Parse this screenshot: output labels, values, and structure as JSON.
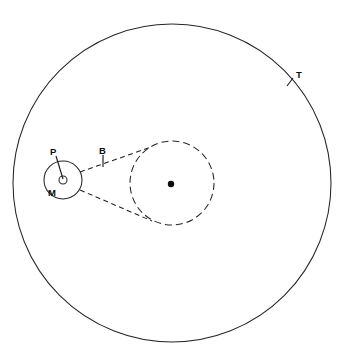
{
  "figure": {
    "background_color": "#ffffff",
    "stroke_color": "#262626",
    "label_color": "#0d0d0d",
    "width": 345,
    "height": 362
  },
  "labels": {
    "outer_orbit": "T",
    "small_body": "P",
    "small_orbit": "M",
    "tangent": "B"
  },
  "shapes": {
    "outer_circle": {
      "name": "outer-orbit-circle",
      "cx": 172,
      "cy": 183,
      "r": 159,
      "style": "solid"
    },
    "dashed_circle": {
      "name": "dashed-orbit-circle",
      "cx": 172,
      "cy": 183,
      "r": 42,
      "style": "dashed"
    },
    "small_circle": {
      "name": "small-orbit-circle",
      "cx": 63,
      "cy": 180,
      "r": 19,
      "style": "solid"
    },
    "tiny_circle": {
      "name": "observer-marker-circle",
      "cx": 63,
      "cy": 180,
      "r": 4,
      "style": "solid-open"
    },
    "center_dot": {
      "name": "center-body-dot",
      "cx": 171,
      "cy": 184,
      "r": 3.2,
      "style": "filled"
    }
  },
  "tangents": [
    {
      "name": "upper-tangent-line",
      "x1": 80,
      "y1": 172,
      "x2": 151,
      "y2": 147
    },
    {
      "name": "lower-tangent-line",
      "x1": 80,
      "y1": 190,
      "x2": 152,
      "y2": 221
    }
  ],
  "leaders": [
    {
      "name": "label-leader-T",
      "x1": 293,
      "y1": 78,
      "x2": 287,
      "y2": 86
    },
    {
      "name": "label-leader-P",
      "x1": 56,
      "y1": 156,
      "x2": 63,
      "y2": 179
    },
    {
      "name": "label-leader-B",
      "x1": 103,
      "y1": 155,
      "x2": 103,
      "y2": 167
    }
  ],
  "label_positions": {
    "outer_orbit": {
      "x": 296,
      "y": 78
    },
    "small_body": {
      "x": 50,
      "y": 155
    },
    "small_orbit": {
      "x": 48,
      "y": 196
    },
    "tangent": {
      "x": 99,
      "y": 154
    }
  }
}
